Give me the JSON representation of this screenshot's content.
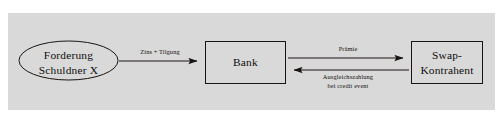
{
  "figure": {
    "type": "flow-diagram",
    "background_color": "#ffffff",
    "panel_color": "#d9d9d9",
    "stroke_color": "#1a1513"
  },
  "nodes": [
    {
      "id": "debtor",
      "shape": "ellipse",
      "line1": "Forderung",
      "line2": "Schuldner X"
    },
    {
      "id": "bank",
      "shape": "rectangle",
      "line1": "Bank",
      "line2": ""
    },
    {
      "id": "counterparty",
      "shape": "rectangle",
      "line1": "Swap-",
      "line2": "Kontrahent"
    }
  ],
  "edges": [
    {
      "id": "interest",
      "from": "debtor",
      "to": "bank",
      "direction": "right",
      "line1": "Zins + Tilgung",
      "line2": ""
    },
    {
      "id": "premium",
      "from": "bank",
      "to": "counterparty",
      "direction": "right",
      "line1": "Prämie",
      "line2": ""
    },
    {
      "id": "settlement",
      "from": "counterparty",
      "to": "bank",
      "direction": "left",
      "line1": "Ausgleichszahlung",
      "line2": "bei credit event"
    }
  ]
}
